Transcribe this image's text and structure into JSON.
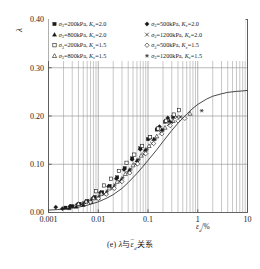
{
  "caption": {
    "prefix": "(e)",
    "symbol_y": "λ",
    "connector": "与",
    "symbol_x": "ε",
    "symbol_x_sub": "d",
    "suffix": "关系",
    "full": "(e) λ与εd关系"
  },
  "axes": {
    "ylabel": "λ",
    "xlabel_main": "ε",
    "xlabel_sub": "d",
    "xlabel_unit": "/%",
    "x_ticks": [
      "0.001",
      "0.01",
      "0.1",
      "1",
      "10"
    ],
    "x_tick_values": [
      0.001,
      0.01,
      0.1,
      1,
      10
    ],
    "y_ticks": [
      "0.00",
      "0.10",
      "0.20",
      "0.30",
      "0.40"
    ],
    "y_tick_values": [
      0.0,
      0.1,
      0.2,
      0.3,
      0.4
    ],
    "xscale": "log",
    "xlim": [
      0.001,
      10
    ],
    "ylim": [
      0.0,
      0.4
    ],
    "grid": "minor-vertical-and-major-horizontal"
  },
  "legend": {
    "position": "top-inside",
    "columns": 2,
    "entries": [
      {
        "marker": "filled-square",
        "sigma": "σ",
        "sigma_sub": "3",
        "value": "200kPa",
        "kc": "K",
        "kc_sub": "c",
        "kc_value": "2.0"
      },
      {
        "marker": "filled-diamond",
        "sigma": "σ",
        "sigma_sub": "3",
        "value": "500kPa",
        "kc": "K",
        "kc_sub": "c",
        "kc_value": "2.0"
      },
      {
        "marker": "filled-triangle",
        "sigma": "σ",
        "sigma_sub": "3",
        "value": "800kPa",
        "kc": "K",
        "kc_sub": "c",
        "kc_value": "2.0"
      },
      {
        "marker": "cross",
        "sigma": "σ",
        "sigma_sub": "3",
        "value": "1200kPa",
        "kc": "K",
        "kc_sub": "c",
        "kc_value": "2.0"
      },
      {
        "marker": "open-square",
        "sigma": "σ",
        "sigma_sub": "3",
        "value": "200kPa",
        "kc": "K",
        "kc_sub": "c",
        "kc_value": "1.5"
      },
      {
        "marker": "open-diamond",
        "sigma": "σ",
        "sigma_sub": "3",
        "value": "500kPa",
        "kc": "K",
        "kc_sub": "c",
        "kc_value": "1.5"
      },
      {
        "marker": "open-triangle",
        "sigma": "σ",
        "sigma_sub": "3",
        "value": "800kPa",
        "kc": "K",
        "kc_sub": "c",
        "kc_value": "1.5"
      },
      {
        "marker": "asterisk",
        "sigma": "σ",
        "sigma_sub": "3",
        "value": "1200kPa",
        "kc": "K",
        "kc_sub": "c",
        "kc_value": "1.5"
      }
    ]
  },
  "chart_data": {
    "type": "scatter",
    "title": "",
    "xlabel": "εd/%",
    "ylabel": "λ",
    "xscale": "log",
    "xlim": [
      0.001,
      10
    ],
    "ylim": [
      0.0,
      0.4
    ],
    "grid": true,
    "legend_position": "top-inside",
    "colors": {
      "marker": "#1a1a1a",
      "curve": "#1a1a1a",
      "grid": "#9a9a9a",
      "frame": "#555555"
    },
    "fit_curve": {
      "name": "fitted S-curve",
      "x": [
        0.001,
        0.0015,
        0.002,
        0.003,
        0.004,
        0.006,
        0.008,
        0.01,
        0.015,
        0.02,
        0.03,
        0.04,
        0.06,
        0.08,
        0.1,
        0.15,
        0.2,
        0.3,
        0.4,
        0.6,
        0.8,
        1.0,
        1.5,
        2.0,
        3.0,
        4.0,
        6.0,
        8.0,
        10.0
      ],
      "y": [
        0.005,
        0.006,
        0.007,
        0.009,
        0.011,
        0.015,
        0.019,
        0.022,
        0.03,
        0.037,
        0.05,
        0.062,
        0.081,
        0.096,
        0.108,
        0.13,
        0.147,
        0.17,
        0.185,
        0.204,
        0.216,
        0.224,
        0.235,
        0.241,
        0.246,
        0.249,
        0.251,
        0.252,
        0.253
      ]
    },
    "series": [
      {
        "name": "σ3=200kPa, Kc=2.0",
        "marker": "filled-square",
        "points": [
          [
            0.0022,
            0.01
          ],
          [
            0.003,
            0.013
          ],
          [
            0.0042,
            0.018
          ],
          [
            0.006,
            0.024
          ],
          [
            0.0085,
            0.032
          ],
          [
            0.012,
            0.042
          ],
          [
            0.017,
            0.055
          ],
          [
            0.024,
            0.073
          ],
          [
            0.034,
            0.092
          ],
          [
            0.048,
            0.112
          ],
          [
            0.07,
            0.133
          ],
          [
            0.1,
            0.152
          ],
          [
            0.15,
            0.172
          ],
          [
            0.22,
            0.188
          ],
          [
            0.32,
            0.198
          ]
        ]
      },
      {
        "name": "σ3=500kPa, Kc=2.0",
        "marker": "filled-diamond",
        "points": [
          [
            0.0014,
            0.011
          ],
          [
            0.0019,
            0.008
          ],
          [
            0.0027,
            0.013
          ],
          [
            0.0038,
            0.017
          ],
          [
            0.0055,
            0.022
          ],
          [
            0.0078,
            0.03
          ],
          [
            0.011,
            0.041
          ],
          [
            0.016,
            0.054
          ],
          [
            0.023,
            0.07
          ],
          [
            0.033,
            0.089
          ],
          [
            0.048,
            0.11
          ],
          [
            0.07,
            0.131
          ],
          [
            0.11,
            0.155
          ],
          [
            0.17,
            0.178
          ],
          [
            0.25,
            0.196
          ]
        ]
      },
      {
        "name": "σ3=800kPa, Kc=2.0",
        "marker": "filled-triangle",
        "points": [
          [
            0.0026,
            0.009
          ],
          [
            0.0036,
            0.012
          ],
          [
            0.005,
            0.016
          ],
          [
            0.0072,
            0.022
          ],
          [
            0.01,
            0.03
          ],
          [
            0.0145,
            0.04
          ],
          [
            0.0205,
            0.052
          ],
          [
            0.029,
            0.068
          ],
          [
            0.042,
            0.088
          ],
          [
            0.06,
            0.108
          ],
          [
            0.088,
            0.13
          ],
          [
            0.13,
            0.152
          ],
          [
            0.19,
            0.172
          ],
          [
            0.27,
            0.19
          ]
        ]
      },
      {
        "name": "σ3=1200kPa, Kc=2.0",
        "marker": "cross",
        "points": [
          [
            0.0032,
            0.013
          ],
          [
            0.0046,
            0.017
          ],
          [
            0.0065,
            0.022
          ],
          [
            0.0092,
            0.029
          ],
          [
            0.013,
            0.038
          ],
          [
            0.019,
            0.05
          ],
          [
            0.027,
            0.064
          ],
          [
            0.039,
            0.082
          ],
          [
            0.056,
            0.1
          ],
          [
            0.082,
            0.121
          ],
          [
            0.12,
            0.143
          ],
          [
            0.18,
            0.165
          ],
          [
            0.26,
            0.183
          ],
          [
            0.38,
            0.198
          ]
        ]
      },
      {
        "name": "σ3=200kPa, Kc=1.5",
        "marker": "open-square",
        "points": [
          [
            0.009,
            0.044
          ],
          [
            0.013,
            0.056
          ],
          [
            0.018,
            0.07
          ],
          [
            0.026,
            0.086
          ],
          [
            0.037,
            0.103
          ],
          [
            0.053,
            0.12
          ],
          [
            0.076,
            0.138
          ],
          [
            0.11,
            0.156
          ],
          [
            0.16,
            0.174
          ],
          [
            0.23,
            0.19
          ],
          [
            0.33,
            0.203
          ],
          [
            0.42,
            0.212
          ]
        ]
      },
      {
        "name": "σ3=500kPa, Kc=1.5",
        "marker": "open-diamond",
        "points": [
          [
            0.007,
            0.022
          ],
          [
            0.01,
            0.029
          ],
          [
            0.0145,
            0.038
          ],
          [
            0.021,
            0.05
          ],
          [
            0.03,
            0.064
          ],
          [
            0.043,
            0.082
          ],
          [
            0.062,
            0.101
          ],
          [
            0.09,
            0.122
          ],
          [
            0.13,
            0.143
          ],
          [
            0.19,
            0.163
          ],
          [
            0.28,
            0.18
          ],
          [
            0.4,
            0.19
          ],
          [
            0.55,
            0.195
          ]
        ]
      },
      {
        "name": "σ3=800kPa, Kc=1.5",
        "marker": "open-triangle",
        "points": [
          [
            0.004,
            0.018
          ],
          [
            0.0057,
            0.023
          ],
          [
            0.008,
            0.03
          ],
          [
            0.0115,
            0.039
          ],
          [
            0.0165,
            0.05
          ],
          [
            0.024,
            0.064
          ],
          [
            0.035,
            0.08
          ],
          [
            0.05,
            0.098
          ],
          [
            0.073,
            0.118
          ],
          [
            0.105,
            0.138
          ],
          [
            0.15,
            0.158
          ],
          [
            0.22,
            0.176
          ],
          [
            0.32,
            0.19
          ],
          [
            0.7,
            0.205
          ]
        ]
      },
      {
        "name": "σ3=1200kPa, Kc=1.5",
        "marker": "asterisk",
        "points": [
          [
            0.005,
            0.02
          ],
          [
            0.0072,
            0.026
          ],
          [
            0.0105,
            0.034
          ],
          [
            0.015,
            0.044
          ],
          [
            0.0215,
            0.057
          ],
          [
            0.031,
            0.072
          ],
          [
            0.045,
            0.09
          ],
          [
            0.065,
            0.11
          ],
          [
            0.095,
            0.131
          ],
          [
            0.14,
            0.152
          ],
          [
            0.2,
            0.171
          ],
          [
            0.3,
            0.187
          ],
          [
            0.45,
            0.198
          ],
          [
            1.2,
            0.211
          ]
        ]
      }
    ]
  }
}
